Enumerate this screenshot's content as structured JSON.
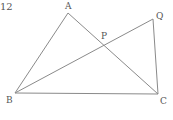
{
  "problem": {
    "number": "12"
  },
  "figure": {
    "stroke_color": "#8a8a8a",
    "label_color": "#555555",
    "points": {
      "A": {
        "label": "A",
        "x": 68,
        "y": 13
      },
      "B": {
        "label": "B",
        "x": 15,
        "y": 93
      },
      "C": {
        "label": "C",
        "x": 158,
        "y": 94
      },
      "Q": {
        "label": "Q",
        "x": 153,
        "y": 19
      },
      "P": {
        "label": "P",
        "x": 104,
        "y": 45
      }
    },
    "segments": [
      [
        "A",
        "B"
      ],
      [
        "A",
        "C"
      ],
      [
        "B",
        "C"
      ],
      [
        "B",
        "Q"
      ],
      [
        "Q",
        "C"
      ]
    ]
  }
}
